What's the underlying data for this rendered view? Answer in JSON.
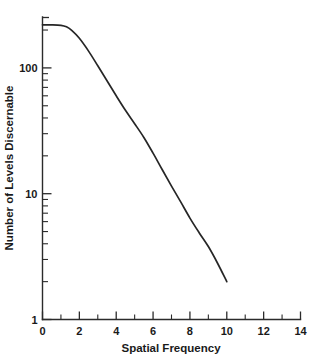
{
  "chart_data": {
    "type": "line",
    "title": "",
    "subtitle": "",
    "xlabel": "Spatial Frequency",
    "ylabel": "Number of Levels Discernable",
    "xscale": "linear",
    "yscale": "log",
    "xlim": [
      0,
      14
    ],
    "ylim": [
      1,
      300
    ],
    "grid": false,
    "legend": null,
    "legend_position": "none",
    "x_major_ticks": [
      0,
      2,
      4,
      6,
      8,
      10,
      12,
      14
    ],
    "x_major_tick_labels": [
      "0",
      "2",
      "4",
      "6",
      "8",
      "10",
      "12",
      "14"
    ],
    "x_minor_ticks": [
      1,
      3,
      5,
      7,
      9,
      11,
      13
    ],
    "y_major_ticks": [
      1,
      10,
      100
    ],
    "y_major_tick_labels": [
      "1",
      "10",
      "100"
    ],
    "y_minor_ticks": [
      2,
      3,
      4,
      5,
      6,
      7,
      8,
      9,
      20,
      30,
      40,
      50,
      60,
      70,
      80,
      90,
      200,
      300
    ],
    "series": [
      {
        "name": "Levels Discernable",
        "color": "#262626",
        "x": [
          0.0,
          0.5,
          1.0,
          1.3,
          1.6,
          2.0,
          2.5,
          3.0,
          3.5,
          4.0,
          4.5,
          5.0,
          5.5,
          6.0,
          6.5,
          7.0,
          7.5,
          8.0,
          8.5,
          9.0,
          9.5,
          10.0
        ],
        "y": [
          220,
          220,
          218,
          212,
          198,
          172,
          136,
          104,
          79,
          60,
          46,
          36,
          28,
          21,
          15.5,
          11.5,
          8.6,
          6.4,
          4.9,
          3.8,
          2.8,
          2.0
        ]
      }
    ],
    "annotations": []
  },
  "figure": {
    "background_color": "#ffffff",
    "axis_color": "#2b2b2b",
    "text_color": "#1a1a1a"
  }
}
